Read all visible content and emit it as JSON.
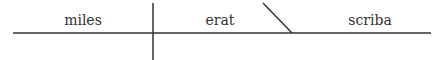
{
  "diagram": {
    "type": "sentence-diagram",
    "subject": "miles",
    "verb": "erat",
    "predicate_nominative": "scriba",
    "line_color": "#333333",
    "text_color": "#333333"
  }
}
